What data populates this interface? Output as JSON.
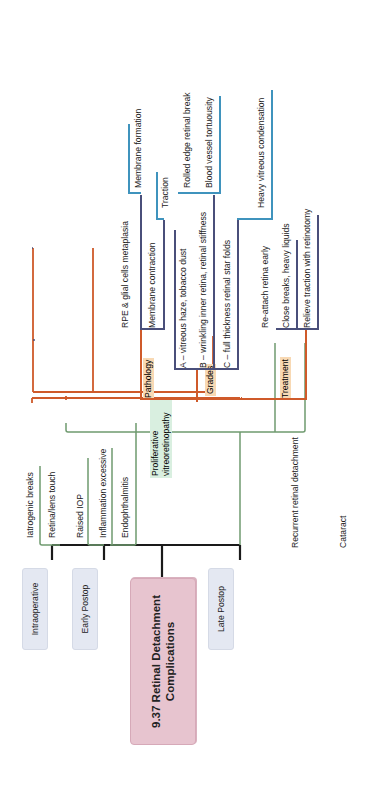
{
  "root": {
    "line1": "9.37 Retinal Detachment",
    "line2": "Complications"
  },
  "colors": {
    "root_fill": "#e7c4cf",
    "category_fill": "#e4e8f2",
    "orange_branch": "#cf5a2a",
    "green_branch": "#6f9a6f",
    "purple_branch": "#4a4f7a",
    "blue_branch": "#3f93bd",
    "orange_tag": "#f8d9b4",
    "green_tag": "#d9efe0"
  },
  "categories": {
    "intraoperative": {
      "label": "Intraoperative",
      "items": [
        "Iatrogenic breaks",
        "Retina/lens touch"
      ]
    },
    "early_postop": {
      "label": "Early Postop",
      "items": [
        "Raised IOP",
        "Inflammation excessive",
        "Endophthalmitis"
      ]
    },
    "late_postop": {
      "label": "Late Postop",
      "pvr": {
        "label_line1": "Proliferative",
        "label_line2": "vitreoretinopathy",
        "pathology": {
          "label": "Pathology",
          "items": [
            "RPE & glial cells metaplasia",
            "Membrane contraction"
          ],
          "sub": {
            "membrane_formation": "Membrane formation",
            "traction": "Traction"
          }
        },
        "grades": {
          "label": "Grades",
          "items": [
            "A – vitreous haze, tobacco dust",
            "B – wrinkling inner retina, retinal stiffness",
            "C – full thickness retinal star folds"
          ],
          "sub": {
            "b": [
              "Rolled edge retinal break",
              "Blood vessel tortuousity"
            ],
            "c": [
              "Heavy vitreous condensation"
            ]
          }
        },
        "treatment": {
          "label": "Treatment",
          "items": [
            "Re-attach retina early",
            "Close breaks, heavy liquids",
            "Relieve traction with retinotomy"
          ]
        }
      },
      "items": [
        "Recurrent retinal detachment",
        "Cataract"
      ]
    }
  }
}
